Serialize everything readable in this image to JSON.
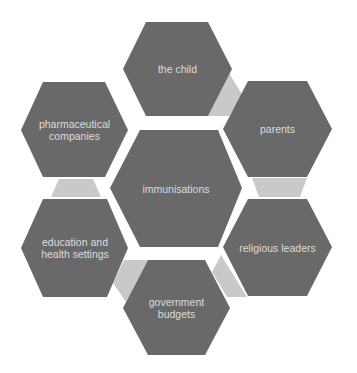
{
  "diagram": {
    "type": "hexagon-cluster",
    "colors": {
      "background": "#ffffff",
      "hex_fill": "#696969",
      "hex_text": "#dcdcdc",
      "connector_fill": "#c9c9c9"
    },
    "center": {
      "label": "immunisations"
    },
    "nodes": [
      {
        "id": "child",
        "label": "the child"
      },
      {
        "id": "parents",
        "label": "parents"
      },
      {
        "id": "religious",
        "label": "religious leaders"
      },
      {
        "id": "government",
        "label": "government budgets"
      },
      {
        "id": "education",
        "label": "education and health settings"
      },
      {
        "id": "pharma",
        "label": "pharmaceutical companies"
      }
    ],
    "connectors": [
      {
        "from": "the child",
        "to": "parents"
      },
      {
        "from": "parents",
        "to": "religious leaders"
      },
      {
        "from": "religious leaders",
        "to": "government budgets"
      },
      {
        "from": "government budgets",
        "to": "education and health settings"
      },
      {
        "from": "education and health settings",
        "to": "pharmaceutical companies"
      }
    ]
  }
}
